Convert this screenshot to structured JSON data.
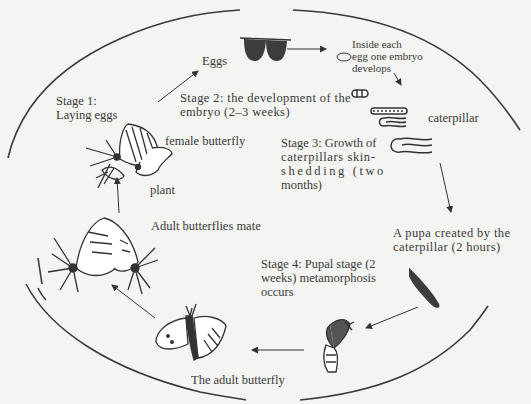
{
  "diagram": {
    "type": "cycle",
    "labels": {
      "stage1": "Stage 1:",
      "stage1_b": "Laying eggs",
      "eggs": "Eggs",
      "embryo_a": "Inside each",
      "embryo_b": "egg one embryo",
      "embryo_c": "develops",
      "stage2_a": "Stage 2: the development of the",
      "stage2_b": "embryo (2–3 weeks)",
      "caterpillar": "caterpillar",
      "female_butterfly": "female butterfly",
      "plant": "plant",
      "stage3_a": "Stage 3: Growth of",
      "stage3_b": "caterpillars skin-",
      "stage3_c": "shedding (two",
      "stage3_d": "months)",
      "mate": "Adult butterflies mate",
      "pupa_a": "A pupa created by the",
      "pupa_b": "caterpillar (2 hours)",
      "stage4_a": "Stage 4: Pupal stage (2",
      "stage4_b": "weeks) metamorphosis",
      "stage4_c": "occurs",
      "adult": "The adult butterfly"
    },
    "nodes": [
      {
        "id": "female-butterfly-on-plant",
        "label": "female butterfly / plant"
      },
      {
        "id": "eggs",
        "label": "Eggs"
      },
      {
        "id": "embryo",
        "label": "Inside each egg one embryo develops"
      },
      {
        "id": "caterpillar",
        "label": "caterpillar"
      },
      {
        "id": "pupa",
        "label": "A pupa created by the caterpillar (2 hours)"
      },
      {
        "id": "emerging",
        "label": "Stage 4: Pupal stage (2 weeks) metamorphosis occurs"
      },
      {
        "id": "adult",
        "label": "The adult butterfly"
      },
      {
        "id": "mating",
        "label": "Adult butterflies mate"
      }
    ],
    "edges": [
      [
        "female-butterfly-on-plant",
        "eggs"
      ],
      [
        "eggs",
        "embryo"
      ],
      [
        "embryo",
        "caterpillar"
      ],
      [
        "caterpillar",
        "pupa"
      ],
      [
        "pupa",
        "emerging"
      ],
      [
        "emerging",
        "adult"
      ],
      [
        "adult",
        "mating"
      ],
      [
        "mating",
        "female-butterfly-on-plant"
      ]
    ],
    "colors": {
      "background": "#f4f4f2",
      "ink": "#333333",
      "fill_dark": "#3c3c3c"
    }
  }
}
